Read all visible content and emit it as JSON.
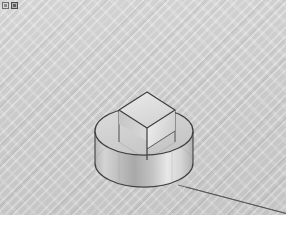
{
  "app": {
    "title": "3D Modeling Viewport",
    "viewport_label": "perspective-view",
    "background_color": "#c9c9c9",
    "background_style": "diagonal-hatch"
  },
  "toolstrip": {
    "icons": [
      {
        "name": "select-tool-icon",
        "label": "Select",
        "selected": false
      },
      {
        "name": "move-tool-icon",
        "label": "Move",
        "selected": true
      }
    ]
  },
  "scene": {
    "name": "cylinder-with-box-on-top",
    "shading": "shaded-with-edges",
    "projection": "perspective",
    "edge_color": "#3a3a3a",
    "objects": [
      {
        "id": "cylinder",
        "name": "cylinder-solid",
        "type": "cylinder",
        "top_ellipse": {
          "cx": 144,
          "cy": 131,
          "rx": 49,
          "ry": 24
        },
        "bottom_ellipse": {
          "cx": 144,
          "cy": 163,
          "rx": 49,
          "ry": 24
        },
        "height_px": 32,
        "fill_light": "#e6e6e6",
        "fill_dark": "#a8a8a8"
      },
      {
        "id": "box",
        "name": "box-solid",
        "type": "box",
        "top_face_points": "119,110 147,92 175,110 147,128",
        "left_face_points": "119,110 147,128 147,160 119,142",
        "right_face_points": "147,128 175,110 175,142 147,160",
        "fill_top": "#e3e3e3",
        "fill_left": "#d2d2d2",
        "fill_right": "#ededed"
      }
    ],
    "guide_line": {
      "name": "ground-axis-line",
      "from": [
        178,
        185
      ],
      "to": [
        286,
        213
      ],
      "color": "#4a4a4a"
    }
  }
}
